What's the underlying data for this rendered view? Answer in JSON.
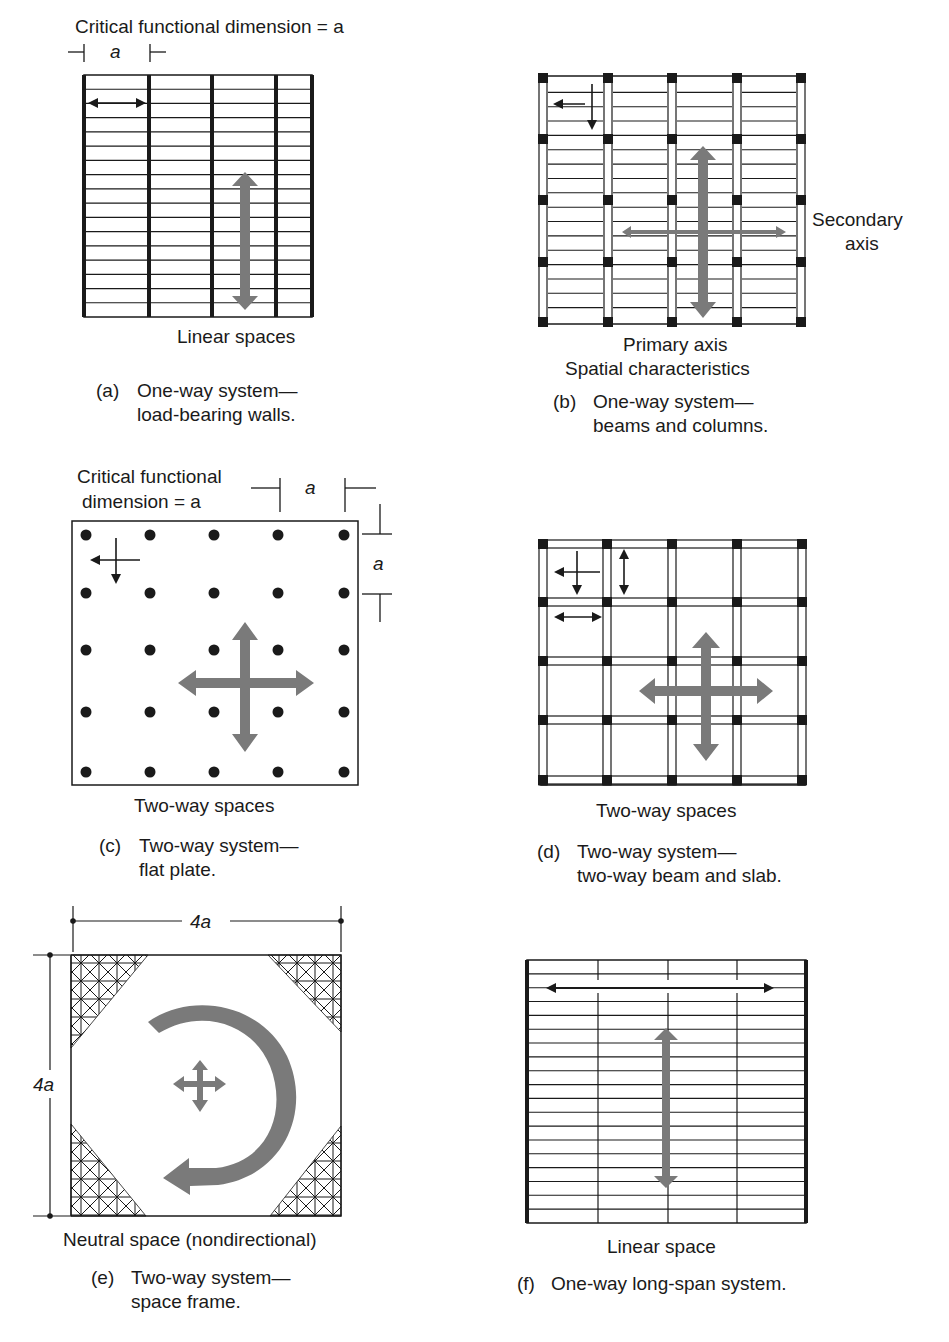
{
  "colors": {
    "ink": "#1a1a1a",
    "gray_arrow": "#7a7a7a",
    "background": "#ffffff"
  },
  "panels": [
    {
      "id": "a",
      "heading": "Critical functional dimension = a",
      "dimension_label": "a",
      "space_label": "Linear spaces",
      "caption_letter": "(a)",
      "caption_line1": "One-way system—",
      "caption_line2": "load-bearing walls.",
      "bays": 4,
      "joist_lines": 16,
      "icons": [
        "double-arrow-horizontal-icon",
        "gray-double-arrow-vertical-icon"
      ]
    },
    {
      "id": "b",
      "side_label_line1": "Secondary",
      "side_label_line2": "axis",
      "primary_label": "Primary axis",
      "space_label": "Spatial characteristics",
      "caption_letter": "(b)",
      "caption_line1": "One-way system—",
      "caption_line2": "beams and columns.",
      "bays": 4,
      "column_rows": 5,
      "icons": [
        "four-way-arrow-icon",
        "gray-primary-axis-arrow-icon",
        "gray-secondary-axis-arrow-icon"
      ]
    },
    {
      "id": "c",
      "heading_line1": "Critical functional",
      "heading_line2": "dimension = a",
      "dimension_label_h": "a",
      "dimension_label_v": "a",
      "space_label": "Two-way spaces",
      "caption_letter": "(c)",
      "caption_line1": "Two-way system—",
      "caption_line2": "flat plate.",
      "column_grid": [
        5,
        5
      ],
      "icons": [
        "four-way-arrow-icon",
        "gray-four-way-arrow-icon"
      ]
    },
    {
      "id": "d",
      "space_label": "Two-way spaces",
      "caption_letter": "(d)",
      "caption_line1": "Two-way system—",
      "caption_line2": "two-way beam and slab.",
      "column_grid": [
        5,
        5
      ],
      "icons": [
        "four-way-arrow-icon",
        "double-arrow-vertical-icon",
        "double-arrow-horizontal-icon",
        "gray-four-way-arrow-icon"
      ]
    },
    {
      "id": "e",
      "dimension_top": "4a",
      "dimension_left": "4a",
      "space_label": "Neutral space (nondirectional)",
      "caption_letter": "(e)",
      "caption_line1": "Two-way system—",
      "caption_line2": "space frame.",
      "icons": [
        "gray-curved-arrow-icon",
        "gray-four-way-arrow-icon",
        "space-frame-hatch"
      ]
    },
    {
      "id": "f",
      "space_label": "Linear space",
      "caption_letter": "(f)",
      "caption_line1": "One-way long-span system.",
      "bays": 4,
      "joist_lines": 18,
      "icons": [
        "double-arrow-horizontal-icon",
        "gray-double-arrow-vertical-icon"
      ]
    }
  ]
}
